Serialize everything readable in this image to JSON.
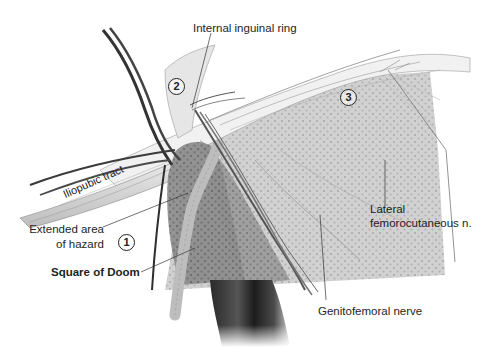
{
  "figure": {
    "labels": {
      "internal_ring": "Internal inguinal ring",
      "iliopubic_tract": "Iliopubic tract",
      "extended_area_line1": "Extended area",
      "extended_area_line2": "of hazard",
      "square_of_doom": "Square of Doom",
      "lateral_fem_line1": "Lateral",
      "lateral_fem_line2": "femorocutaneous n.",
      "genitofemoral": "Genitofemoral nerve"
    },
    "region_markers": {
      "one": "1",
      "two": "2",
      "three": "3"
    },
    "colors": {
      "background": "#ffffff",
      "text": "#1e1e1e",
      "mesh_region": "#c9c9c9",
      "dark_vessel": "#3a3a3a",
      "hazard_area": "#8a8a8a"
    }
  }
}
